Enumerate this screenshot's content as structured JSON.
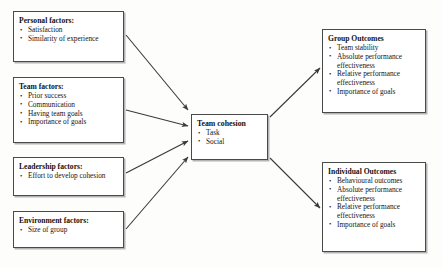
{
  "diagram": {
    "line_color": "#4a4a4a",
    "text_color": "#141414",
    "background": "#fdfdfc"
  },
  "inputs": [
    {
      "id": "personal",
      "title": "Personal factors:",
      "bullets": [
        "Satisfaction",
        "Similarity of experience"
      ]
    },
    {
      "id": "team",
      "title": "Team factors:",
      "bullets": [
        "Prior success",
        "Communication",
        "Having team goals",
        "Importance of goals"
      ]
    },
    {
      "id": "leadership",
      "title": "Leadership factors:",
      "bullets": [
        "Effort to develop cohesion"
      ]
    },
    {
      "id": "environment",
      "title": "Environment factors:",
      "bullets": [
        "Size of group"
      ]
    }
  ],
  "centre": {
    "id": "cohesion",
    "title": "Team cohesion",
    "bullets": [
      "Task",
      "Social"
    ]
  },
  "outcomes": [
    {
      "id": "group",
      "title": "Group Outcomes",
      "bullets": [
        "Team stability",
        "Absolute performance effectiveness",
        "Relative performance effectiveness",
        "Importance of goals"
      ]
    },
    {
      "id": "individual",
      "title": "Individual Outcomes",
      "bullets": [
        "Behavioural outcomes",
        "Absolute performance effectiveness",
        "Relative performance effectiveness",
        "Importance of goals"
      ]
    }
  ],
  "arrows": [
    {
      "name": "personal-to-cohesion",
      "from": "personal",
      "to": "cohesion"
    },
    {
      "name": "team-to-cohesion",
      "from": "team",
      "to": "cohesion"
    },
    {
      "name": "leadership-to-cohesion",
      "from": "leadership",
      "to": "cohesion"
    },
    {
      "name": "environment-to-cohesion",
      "from": "environment",
      "to": "cohesion"
    },
    {
      "name": "cohesion-to-group",
      "from": "cohesion",
      "to": "group"
    },
    {
      "name": "cohesion-to-individual",
      "from": "cohesion",
      "to": "individual"
    }
  ]
}
